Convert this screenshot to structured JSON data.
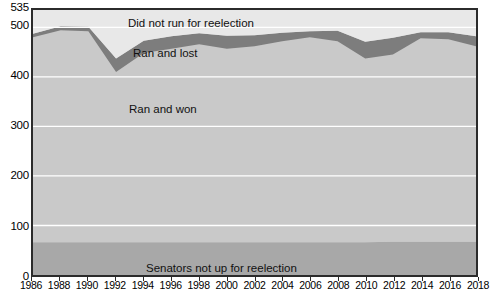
{
  "chart_data": {
    "type": "area",
    "stacked": true,
    "title": "",
    "subtitle": "",
    "xlabel": "",
    "ylabel": "",
    "xlim": [
      1986,
      2018
    ],
    "ylim": [
      0,
      535
    ],
    "grid": true,
    "grid_axis": "y",
    "grid_color": "#ffffff",
    "legend_position": "inline-on-bands",
    "plot_background": "#c9c9c9",
    "frame_color": "#2b2b2b",
    "x": [
      1986,
      1988,
      1990,
      1992,
      1994,
      1996,
      1998,
      2000,
      2002,
      2004,
      2006,
      2008,
      2010,
      2012,
      2014,
      2016,
      2018
    ],
    "categories": [
      "1986",
      "1988",
      "1990",
      "1992",
      "1994",
      "1996",
      "1998",
      "2000",
      "2002",
      "2004",
      "2006",
      "2008",
      "2010",
      "2012",
      "2014",
      "2016",
      "2018"
    ],
    "x_tick_labels": [
      "1986",
      "1988",
      "1990",
      "1992",
      "1994",
      "1996",
      "1998",
      "2000",
      "2002",
      "2004",
      "2006",
      "2008",
      "2010",
      "2012",
      "2014",
      "2016",
      "2018"
    ],
    "y_tick_values": [
      0,
      100,
      200,
      300,
      400,
      500,
      535
    ],
    "y_tick_labels": [
      "0",
      "100",
      "200",
      "300",
      "400",
      "500",
      "535"
    ],
    "series": [
      {
        "name": "Senators not up for reelection",
        "color": "#a8a8a8",
        "label_color": "#111111",
        "values": [
          66,
          66,
          66,
          66,
          66,
          66,
          66,
          66,
          66,
          66,
          66,
          66,
          66,
          67,
          67,
          67,
          67
        ]
      },
      {
        "name": "Ran and won",
        "color": "#c9c9c9",
        "label_color": "#111111",
        "values": [
          414,
          428,
          426,
          344,
          382,
          391,
          400,
          391,
          396,
          406,
          414,
          406,
          371,
          378,
          411,
          409,
          395
        ]
      },
      {
        "name": "Ran and lost",
        "color": "#7d7d7d",
        "label_color": "#111111",
        "values": [
          7,
          8,
          9,
          27,
          25,
          25,
          22,
          26,
          22,
          17,
          12,
          21,
          34,
          34,
          12,
          14,
          20
        ]
      },
      {
        "name": "Did not run for reelection",
        "color": "#e8e8e8",
        "label_color": "#111111",
        "values": [
          48,
          33,
          34,
          98,
          62,
          53,
          47,
          52,
          51,
          46,
          43,
          42,
          64,
          56,
          45,
          45,
          53
        ]
      }
    ],
    "totals_ran_and_won_top": [
      487,
      502,
      501,
      437,
      473,
      482,
      488,
      483,
      484,
      489,
      492,
      493,
      471,
      479,
      490,
      490,
      482
    ],
    "annotations": [
      {
        "text": "Did not run for reelection",
        "x_px": 95,
        "y_px": 7
      },
      {
        "text": "Ran and lost",
        "x_px": 100,
        "y_px": 37
      },
      {
        "text": "Ran and won",
        "x_px": 96,
        "y_px": 93
      },
      {
        "text": "Senators not up for reelection",
        "x_px": 113,
        "y_px": 252
      }
    ]
  },
  "labels": {
    "did_not_run": "Did not run for reelection",
    "ran_and_lost": "Ran and lost",
    "ran_and_won": "Ran and won",
    "not_up": "Senators not up for reelection"
  },
  "colors": {
    "band_not_up": "#a8a8a8",
    "band_ran_won": "#c9c9c9",
    "band_ran_lost": "#7d7d7d",
    "band_did_not_run": "#e8e8e8",
    "gridline": "#ffffff",
    "frame": "#2b2b2b",
    "text": "#000000"
  }
}
